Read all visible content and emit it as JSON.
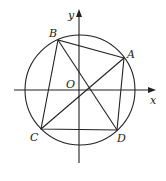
{
  "diagram": {
    "type": "geometry-circle-inscribed-quadrilateral",
    "axes": {
      "x_label": "x",
      "y_label": "y",
      "origin_label": "O"
    },
    "points": {
      "A": {
        "label": "A",
        "x": 124,
        "y": 58
      },
      "B": {
        "label": "B",
        "x": 58,
        "y": 40
      },
      "C": {
        "label": "C",
        "x": 41,
        "y": 129
      },
      "D": {
        "label": "D",
        "x": 117,
        "y": 130
      }
    },
    "circle": {
      "cx": 80,
      "cy": 90,
      "r": 55
    },
    "segments": [
      "AB",
      "BC",
      "CD",
      "DA",
      "AC",
      "BD"
    ],
    "colors": {
      "stroke": "#222222",
      "background": "#ffffff"
    }
  }
}
